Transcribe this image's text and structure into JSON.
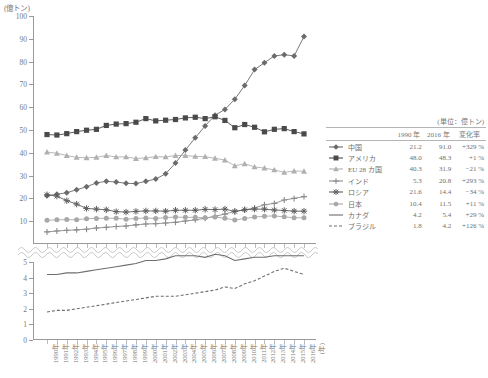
{
  "axis_unit_label": "(億トン)",
  "legend_unit_label": "(単位：億トン)",
  "legend_headers": {
    "marker": "",
    "name": "",
    "y1990": "1990 年",
    "y2016": "2016 年",
    "rate": "変化率"
  },
  "chart_data": {
    "type": "line",
    "title": "",
    "xlabel": "(年)",
    "ylabel": "(億トン)",
    "ylim": [
      0,
      100
    ],
    "ylim_lower": [
      0,
      5
    ],
    "yticks": [
      0,
      10,
      20,
      30,
      40,
      50,
      60,
      70,
      80,
      90,
      100
    ],
    "yticks_lower": [
      0,
      1,
      2,
      3,
      4,
      5
    ],
    "grid": false,
    "legend_position": "right",
    "broken_axis": true,
    "x": [
      1990,
      1991,
      1992,
      1993,
      1994,
      1995,
      1996,
      1997,
      1998,
      1999,
      2000,
      2001,
      2002,
      2003,
      2004,
      2005,
      2006,
      2007,
      2008,
      2009,
      2010,
      2011,
      2012,
      2013,
      2014,
      2015,
      2016
    ],
    "xtick_labels": [
      "1990年",
      "1991年",
      "1992年",
      "1993年",
      "1994年",
      "1995年",
      "1996年",
      "1997年",
      "1998年",
      "1999年",
      "2000年",
      "2001年",
      "2002年",
      "2003年",
      "2004年",
      "2005年",
      "2006年",
      "2007年",
      "2008年",
      "2009年",
      "2010年",
      "2011年",
      "2012年",
      "2013年",
      "2014年",
      "2015年",
      "2016年"
    ],
    "series": [
      {
        "name": "中国",
        "marker": "diamond",
        "color": "#6b6b6b",
        "panel": "upper",
        "y1990": "21.2",
        "y2016": "91.0",
        "rate": "+329 %",
        "values": [
          21.2,
          21.8,
          22.5,
          23.8,
          25.1,
          26.8,
          27.5,
          27.2,
          26.6,
          26.5,
          27.5,
          28.5,
          30.8,
          35.5,
          41.2,
          46.6,
          51.8,
          56.5,
          59.0,
          63.5,
          69.5,
          76.5,
          79.5,
          82.5,
          83.0,
          82.5,
          91.0
        ]
      },
      {
        "name": "アメリカ",
        "marker": "square",
        "color": "#4a4a4a",
        "panel": "upper",
        "y1990": "48.0",
        "y2016": "48.3",
        "rate": "+1 %",
        "values": [
          48.0,
          47.8,
          48.4,
          49.3,
          49.9,
          50.3,
          52.0,
          52.6,
          52.8,
          53.4,
          55.0,
          54.0,
          54.3,
          54.6,
          55.3,
          55.6,
          55.0,
          55.8,
          54.2,
          51.0,
          52.4,
          51.2,
          49.2,
          50.3,
          50.6,
          49.3,
          48.3
        ]
      },
      {
        "name": "EU 28 カ国",
        "marker": "triangle",
        "color": "#b0b0b0",
        "panel": "upper",
        "y1990": "40.3",
        "y2016": "31.9",
        "rate": "−21 %",
        "values": [
          40.3,
          39.8,
          38.8,
          38.0,
          37.8,
          38.0,
          38.8,
          38.2,
          38.2,
          37.5,
          37.8,
          38.3,
          38.2,
          38.8,
          38.8,
          38.4,
          38.3,
          37.6,
          36.8,
          34.3,
          35.2,
          33.8,
          33.3,
          32.5,
          31.4,
          32.0,
          31.9
        ]
      },
      {
        "name": "インド",
        "marker": "plus",
        "color": "#8a8a8a",
        "panel": "upper",
        "y1990": "5.3",
        "y2016": "20.8",
        "rate": "+293 %",
        "values": [
          5.3,
          5.7,
          6.0,
          6.2,
          6.5,
          7.0,
          7.3,
          7.7,
          7.9,
          8.4,
          8.8,
          8.9,
          9.2,
          9.5,
          10.1,
          10.6,
          11.3,
          12.2,
          13.1,
          14.3,
          15.0,
          15.8,
          17.2,
          17.8,
          19.3,
          20.0,
          20.8
        ]
      },
      {
        "name": "ロシア",
        "marker": "star",
        "color": "#5d5d5d",
        "panel": "upper",
        "y1990": "21.6",
        "y2016": "14.4",
        "rate": "−34 %",
        "values": [
          21.6,
          21.0,
          19.0,
          17.5,
          15.6,
          15.3,
          15.0,
          14.2,
          14.0,
          14.3,
          14.5,
          14.5,
          14.4,
          14.8,
          14.8,
          14.8,
          15.2,
          15.1,
          15.3,
          14.3,
          15.0,
          15.3,
          15.3,
          14.9,
          14.7,
          14.4,
          14.4
        ]
      },
      {
        "name": "日本",
        "marker": "circle",
        "color": "#a8a8a8",
        "panel": "upper",
        "y1990": "10.4",
        "y2016": "11.5",
        "rate": "+11 %",
        "values": [
          10.4,
          10.6,
          10.7,
          10.6,
          11.1,
          11.2,
          11.3,
          11.3,
          10.9,
          11.2,
          11.4,
          11.2,
          11.6,
          11.8,
          11.7,
          11.7,
          11.5,
          11.8,
          11.3,
          10.5,
          11.2,
          11.8,
          12.2,
          12.3,
          11.9,
          11.5,
          11.5
        ]
      },
      {
        "name": "カナダ",
        "marker": "line-solid",
        "color": "#6e6e6e",
        "panel": "lower",
        "y1990": "4.2",
        "y2016": "5.4",
        "rate": "+29 %",
        "values": [
          4.2,
          4.2,
          4.3,
          4.3,
          4.4,
          4.5,
          4.6,
          4.7,
          4.8,
          4.9,
          5.1,
          5.1,
          5.2,
          5.4,
          5.4,
          5.4,
          5.3,
          5.5,
          5.4,
          5.1,
          5.2,
          5.3,
          5.3,
          5.4,
          5.4,
          5.4,
          5.4
        ]
      },
      {
        "name": "ブラジル",
        "marker": "line-dashed",
        "color": "#6e6e6e",
        "panel": "lower",
        "y1990": "1.8",
        "y2016": "4.2",
        "rate": "+126 %",
        "values": [
          1.8,
          1.9,
          1.9,
          2.0,
          2.1,
          2.2,
          2.3,
          2.4,
          2.5,
          2.6,
          2.7,
          2.8,
          2.8,
          2.8,
          2.9,
          3.0,
          3.1,
          3.2,
          3.4,
          3.3,
          3.6,
          3.8,
          4.1,
          4.4,
          4.6,
          4.4,
          4.2
        ]
      }
    ]
  }
}
